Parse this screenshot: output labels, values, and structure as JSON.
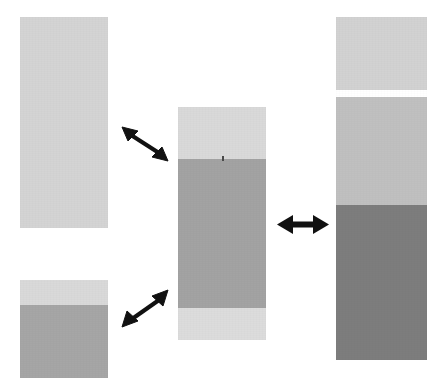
{
  "figure": {
    "background_color": "#ffffff",
    "width": 446,
    "height": 390,
    "palette": {
      "light_gray": "#d5d5d5",
      "lighter_gray": "#d9d9d9",
      "pale_gray": "#dcdcdc",
      "medium_gray": "#a8a8a8",
      "mid_light_gray": "#c2c2c2",
      "dark_gray": "#7f7f7f",
      "arrow_black": "#111111",
      "tick_color": "#4a4a4a"
    }
  },
  "bars": [
    {
      "id": "bar-top-left",
      "name": "top-left-bar",
      "x": 20,
      "y": 17,
      "width": 88,
      "height": 211,
      "segments": [
        {
          "name": "segment-light",
          "label": "light segment",
          "color": "#d4d4d4",
          "top": 0,
          "height": 211
        }
      ]
    },
    {
      "id": "bar-bottom-left",
      "name": "bottom-left-bar",
      "x": 20,
      "y": 280,
      "width": 88,
      "height": 98,
      "segments": [
        {
          "name": "segment-light",
          "label": "light segment",
          "color": "#d9d9d9",
          "top": 0,
          "height": 25
        },
        {
          "name": "segment-medium",
          "label": "medium segment",
          "color": "#a6a6a6",
          "top": 25,
          "height": 73
        }
      ]
    },
    {
      "id": "bar-middle",
      "name": "middle-bar",
      "x": 178,
      "y": 107,
      "width": 88,
      "height": 233,
      "segments": [
        {
          "name": "segment-light-top",
          "label": "light top segment",
          "color": "#d9d9d9",
          "top": 0,
          "height": 52
        },
        {
          "name": "segment-medium",
          "label": "medium middle segment",
          "color": "#a3a3a3",
          "top": 52,
          "height": 149
        },
        {
          "name": "segment-light-bottom",
          "label": "light bottom segment",
          "color": "#dcdcdc",
          "top": 201,
          "height": 32
        }
      ],
      "tick": {
        "name": "segment-boundary-tick",
        "x": 44,
        "y": 49
      }
    },
    {
      "id": "bar-right",
      "name": "right-bar",
      "x": 336,
      "y": 17,
      "width": 91,
      "height": 343,
      "segments": [
        {
          "name": "segment-light-top",
          "label": "light top segment",
          "color": "#d2d2d2",
          "top": 0,
          "height": 73
        },
        {
          "name": "segment-gap",
          "label": "white separator gap",
          "color": "#ffffff",
          "top": 73,
          "height": 7
        },
        {
          "name": "segment-mid-light",
          "label": "mid-light segment",
          "color": "#c0c0c0",
          "top": 80,
          "height": 108
        },
        {
          "name": "segment-dark",
          "label": "dark bottom segment",
          "color": "#7d7d7d",
          "top": 188,
          "height": 155
        }
      ]
    }
  ],
  "arrows": [
    {
      "id": "arrow-upper-left",
      "name": "double-arrow-diagonal-down-right-icon",
      "label": "double-headed diagonal arrow",
      "direction": "down-right",
      "x": 120,
      "y": 124,
      "width": 50,
      "height": 40
    },
    {
      "id": "arrow-lower-left",
      "name": "double-arrow-diagonal-up-right-icon",
      "label": "double-headed diagonal arrow",
      "direction": "up-right",
      "x": 120,
      "y": 288,
      "width": 50,
      "height": 42
    },
    {
      "id": "arrow-right",
      "name": "double-arrow-horizontal-icon",
      "label": "double-headed horizontal arrow",
      "direction": "horizontal",
      "x": 277,
      "y": 212,
      "width": 52,
      "height": 26
    }
  ]
}
